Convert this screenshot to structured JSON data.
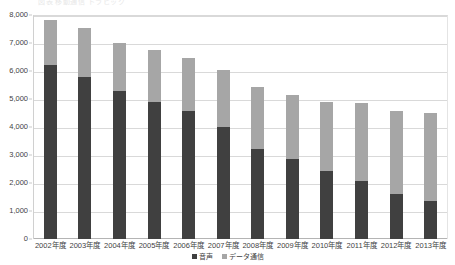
{
  "top_caption": "図表          移動通信       トラヒック",
  "legend": {
    "position": "bottom-center",
    "items": [
      {
        "label": "音声",
        "color": "#404040",
        "key": "voice"
      },
      {
        "label": "データ通信",
        "color": "#a6a6a6",
        "key": "data"
      }
    ]
  },
  "axis": {
    "y_ticks": [
      "0",
      "1,000",
      "2,000",
      "3,000",
      "4,000",
      "5,000",
      "6,000",
      "7,000",
      "8,000"
    ],
    "y_tick_values": [
      0,
      1000,
      2000,
      3000,
      4000,
      5000,
      6000,
      7000,
      8000
    ]
  },
  "colors": {
    "voice": "#404040",
    "data": "#a6a6a6",
    "gridline": "#d9d9d9",
    "axis": "#b4b4b4",
    "text": "#3f3f3f",
    "background": "#ffffff"
  },
  "chart_data": {
    "type": "bar",
    "stacked": true,
    "title": "",
    "xlabel": "",
    "ylabel": "",
    "ylim": [
      0,
      8000
    ],
    "grid": true,
    "legend_position": "bottom-center",
    "categories": [
      "2002年度",
      "2003年度",
      "2004年度",
      "2005年度",
      "2006年度",
      "2007年度",
      "2008年度",
      "2009年度",
      "2010年度",
      "2011年度",
      "2012年度",
      "2013年度"
    ],
    "series": [
      {
        "name": "音声",
        "color": "#404040",
        "values": [
          6220,
          5770,
          5270,
          4900,
          4580,
          3990,
          3230,
          2840,
          2440,
          2060,
          1590,
          1340
        ]
      },
      {
        "name": "データ通信",
        "color": "#a6a6a6",
        "values": [
          1610,
          1770,
          1720,
          1860,
          1890,
          2030,
          2210,
          2300,
          2450,
          2800,
          2970,
          3160
        ]
      }
    ],
    "totals": [
      7830,
      7540,
      6990,
      6760,
      6470,
      6020,
      5440,
      5140,
      4890,
      4860,
      4560,
      4500
    ]
  }
}
